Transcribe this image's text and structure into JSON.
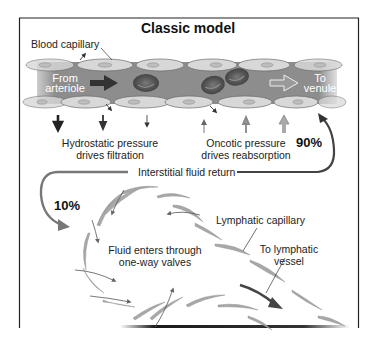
{
  "diagram": {
    "title": "Classic model",
    "labels": {
      "blood_capillary": "Blood capillary",
      "from_arteriole_1": "From",
      "from_arteriole_2": "arteriole",
      "to_venule_1": "To",
      "to_venule_2": "venule",
      "hydrostatic_1": "Hydrostatic pressure",
      "hydrostatic_2": "drives filtration",
      "oncotic_1": "Oncotic pressure",
      "oncotic_2": "drives reabsorption",
      "percent_90": "90%",
      "percent_10": "10%",
      "interstitial_return": "Interstitial fluid return",
      "fluid_enters_1": "Fluid enters through",
      "fluid_enters_2": "one-way valves",
      "lymphatic_capillary": "Lymphatic capillary",
      "to_lymphatic_1": "To lymphatic",
      "to_lymphatic_2": "vessel"
    },
    "colors": {
      "capillary_lumen": "#8a8a8a",
      "endothelial_cell": "#d6d6d6",
      "red_blood_cell": "#5a5a5a",
      "lymph_cell": "#a8a8a8",
      "arrow_dark": "#333333",
      "arrow_mid": "#777777",
      "frame": "#222222"
    }
  }
}
